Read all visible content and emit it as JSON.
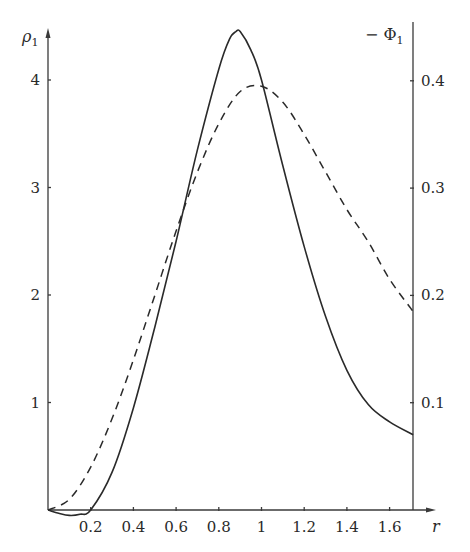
{
  "chart_data": {
    "type": "line",
    "title": "",
    "xlabel": "r",
    "ylabel": "ρ₁",
    "y2label": "−Φ₁",
    "xlim": [
      0,
      1.71
    ],
    "ylim": [
      0,
      4.5
    ],
    "y2lim": [
      0,
      0.45
    ],
    "grid": false,
    "legend": null,
    "x_ticks": [
      0.2,
      0.4,
      0.6,
      0.8,
      1,
      1.2,
      1.4,
      1.6
    ],
    "x_tick_labels": [
      "0.2",
      "0.4",
      "0.6",
      "0.8",
      "1",
      "1.2",
      "1.4",
      "1.6"
    ],
    "y_ticks": [
      1,
      2,
      3,
      4
    ],
    "y_tick_labels": [
      "1",
      "2",
      "3",
      "4"
    ],
    "y2_ticks": [
      0.1,
      0.2,
      0.3,
      0.4
    ],
    "y2_tick_labels": [
      "0.1",
      "0.2",
      "0.3",
      "0.4"
    ],
    "series": [
      {
        "name": "ρ₁",
        "axis": "left",
        "style": "solid",
        "color": "#2a2a2a",
        "x": [
          0,
          0.05,
          0.1,
          0.15,
          0.2,
          0.3,
          0.4,
          0.5,
          0.6,
          0.7,
          0.8,
          0.85,
          0.88,
          0.9,
          0.95,
          1.0,
          1.1,
          1.2,
          1.3,
          1.4,
          1.5,
          1.6,
          1.71
        ],
        "values": [
          0,
          -0.03,
          -0.05,
          -0.04,
          0,
          0.35,
          0.95,
          1.7,
          2.5,
          3.35,
          4.1,
          4.38,
          4.45,
          4.45,
          4.28,
          4.0,
          3.2,
          2.45,
          1.8,
          1.3,
          0.98,
          0.82,
          0.7
        ]
      },
      {
        "name": "−Φ₁",
        "axis": "right",
        "style": "dashed",
        "color": "#2a2a2a",
        "x": [
          0,
          0.1,
          0.2,
          0.3,
          0.4,
          0.5,
          0.6,
          0.7,
          0.8,
          0.9,
          1.0,
          1.1,
          1.2,
          1.3,
          1.4,
          1.5,
          1.6,
          1.71
        ],
        "values": [
          0,
          0.01,
          0.04,
          0.085,
          0.14,
          0.2,
          0.26,
          0.315,
          0.36,
          0.39,
          0.395,
          0.38,
          0.35,
          0.315,
          0.28,
          0.25,
          0.215,
          0.185
        ]
      }
    ]
  },
  "labels": {
    "left_axis_symbol": "ρ",
    "left_axis_subscript": "1",
    "right_axis_symbol": "− Φ",
    "right_axis_subscript": "1",
    "x_axis_symbol": "r"
  }
}
